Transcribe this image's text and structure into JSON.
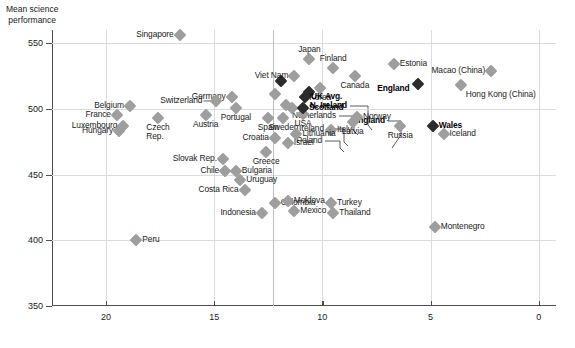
{
  "chart_data": {
    "type": "scatter",
    "title": "",
    "ylabel": "Mean science\nperformance",
    "xlabel": "",
    "ylim": [
      350,
      560
    ],
    "xlim": [
      22.5,
      -0.8
    ],
    "x_reversed": true,
    "grid": true,
    "yticks": [
      550,
      500,
      450,
      400,
      350
    ],
    "xticks": [
      20,
      15,
      10,
      5,
      0
    ],
    "accent_gridline_x": 12.3,
    "colors": {
      "marker": "#9e9e9e",
      "marker_highlight": "#2b2b2b",
      "axis": "#4d4d4d",
      "grid": "#dcdcdc",
      "text": "#1a1a1a"
    },
    "points": [
      {
        "name": "Singapore",
        "x": 16.6,
        "y": 556,
        "label_pos": "r",
        "bold": false
      },
      {
        "name": "N. Ireland",
        "x": 11.9,
        "y": 521,
        "label_pos": "leader",
        "bold": true,
        "label_x": 295,
        "label_y": 76,
        "leader": [
          [
            298,
            76
          ],
          [
            316,
            76
          ],
          [
            316,
            95
          ],
          [
            320,
            100
          ]
        ]
      },
      {
        "name": "Netherlands",
        "x": 12.2,
        "y": 511,
        "label_pos": "leader",
        "bold": false,
        "label_x": 284,
        "label_y": 86,
        "leader": [
          [
            287,
            86
          ],
          [
            302,
            86
          ],
          [
            302,
            101
          ],
          [
            306,
            105
          ]
        ]
      },
      {
        "name": "Ireland",
        "x": 11.7,
        "y": 503,
        "label_pos": "leader",
        "bold": false,
        "label_x": 272,
        "label_y": 99,
        "leader": [
          [
            275,
            99
          ],
          [
            292,
            99
          ],
          [
            292,
            112
          ],
          [
            296,
            116
          ]
        ]
      },
      {
        "name": "Poland",
        "x": 11.4,
        "y": 501,
        "label_pos": "leader",
        "bold": false,
        "label_x": 270,
        "label_y": 111,
        "leader": [
          [
            273,
            111
          ],
          [
            288,
            111
          ],
          [
            288,
            118
          ],
          [
            292,
            122
          ]
        ]
      },
      {
        "name": "England",
        "x": 10.6,
        "y": 513,
        "label_pos": "leader",
        "bold": true,
        "label_x": 333,
        "label_y": 91,
        "leader": [
          [
            336,
            91
          ],
          [
            349,
            91
          ],
          [
            349,
            105
          ],
          [
            340,
            118
          ]
        ]
      },
      {
        "name": "Germany",
        "x": 14.2,
        "y": 509,
        "label_pos": "r",
        "bold": false
      },
      {
        "name": "Switzerland",
        "x": 14.9,
        "y": 506,
        "label_pos": "leaderline",
        "bold": false
      },
      {
        "name": "Belgium",
        "x": 18.9,
        "y": 502,
        "label_pos": "r",
        "bold": false
      },
      {
        "name": "France",
        "x": 19.5,
        "y": 495,
        "label_pos": "r",
        "bold": false
      },
      {
        "name": "Luxembourg",
        "x": 19.2,
        "y": 487,
        "label_pos": "r",
        "bold": false
      },
      {
        "name": "Hungary",
        "x": 19.4,
        "y": 483,
        "label_pos": "r",
        "bold": false
      },
      {
        "name": "Czech\nRep.",
        "x": 17.6,
        "y": 493,
        "label_pos": "below",
        "bold": false
      },
      {
        "name": "Austria",
        "x": 15.4,
        "y": 495,
        "label_pos": "below",
        "bold": false
      },
      {
        "name": "Portugal",
        "x": 14.0,
        "y": 501,
        "label_pos": "below",
        "bold": false
      },
      {
        "name": "Spain",
        "x": 12.5,
        "y": 493,
        "label_pos": "below",
        "bold": false
      },
      {
        "name": "Sweden",
        "x": 11.8,
        "y": 493,
        "label_pos": "below",
        "bold": false
      },
      {
        "name": "USA",
        "x": 10.9,
        "y": 496,
        "label_pos": "below",
        "bold": false
      },
      {
        "name": "Japan",
        "x": 10.6,
        "y": 538,
        "label_pos": "above",
        "bold": false
      },
      {
        "name": "Viet Nam",
        "x": 11.3,
        "y": 525,
        "label_pos": "r",
        "bold": false
      },
      {
        "name": "Finland",
        "x": 9.5,
        "y": 531,
        "label_pos": "above",
        "bold": false
      },
      {
        "name": "Canada",
        "x": 8.5,
        "y": 525,
        "label_pos": "below",
        "bold": false
      },
      {
        "name": "Estonia",
        "x": 6.7,
        "y": 534,
        "label_pos": "l",
        "bold": false
      },
      {
        "name": "Korea",
        "x": 10.1,
        "y": 516,
        "label_pos": "below",
        "bold": false
      },
      {
        "name": "UK Avg.",
        "x": 10.8,
        "y": 509,
        "label_pos": "l",
        "bold": true
      },
      {
        "name": "Scotland",
        "x": 10.9,
        "y": 501,
        "label_pos": "l",
        "bold": true
      },
      {
        "name": "Norway",
        "x": 8.4,
        "y": 494,
        "label_pos": "l",
        "bold": false
      },
      {
        "name": "Latvia",
        "x": 8.6,
        "y": 490,
        "label_pos": "below",
        "bold": false
      },
      {
        "name": "Italy",
        "x": 9.6,
        "y": 484,
        "label_pos": "l",
        "bold": false
      },
      {
        "name": "Lithuania",
        "x": 11.2,
        "y": 481,
        "label_pos": "l",
        "bold": false
      },
      {
        "name": "Israel",
        "x": 11.6,
        "y": 474,
        "label_pos": "l",
        "bold": false
      },
      {
        "name": "Croatia",
        "x": 12.2,
        "y": 478,
        "label_pos": "r",
        "bold": false
      },
      {
        "name": "Greece",
        "x": 12.6,
        "y": 467,
        "label_pos": "below",
        "bold": false
      },
      {
        "name": "Russia",
        "x": 6.4,
        "y": 487,
        "label_pos": "below",
        "bold": false
      },
      {
        "name": "England",
        "x": 5.6,
        "y": 519,
        "label_pos": "belowbold",
        "bold": true
      },
      {
        "name": "Macao (China)",
        "x": 2.2,
        "y": 529,
        "label_pos": "r",
        "bold": false
      },
      {
        "name": "Hong Kong (China)",
        "x": 3.6,
        "y": 518,
        "label_pos": "belowlbl",
        "bold": false
      },
      {
        "name": "Wales",
        "x": 4.9,
        "y": 487,
        "label_pos": "l",
        "bold": true
      },
      {
        "name": "Iceland",
        "x": 4.4,
        "y": 481,
        "label_pos": "l",
        "bold": false
      },
      {
        "name": "Montenegro",
        "x": 4.8,
        "y": 410,
        "label_pos": "l",
        "bold": false
      },
      {
        "name": "Slovak Rep.",
        "x": 14.6,
        "y": 462,
        "label_pos": "r",
        "bold": false
      },
      {
        "name": "Chile",
        "x": 14.5,
        "y": 453,
        "label_pos": "r",
        "bold": false
      },
      {
        "name": "Bulgaria",
        "x": 14.0,
        "y": 453,
        "label_pos": "l",
        "bold": false
      },
      {
        "name": "Uruguay",
        "x": 13.8,
        "y": 446,
        "label_pos": "l",
        "bold": false
      },
      {
        "name": "Costa Rica",
        "x": 13.6,
        "y": 438,
        "label_pos": "r",
        "bold": false
      },
      {
        "name": "Indonesia",
        "x": 12.8,
        "y": 421,
        "label_pos": "r",
        "bold": false
      },
      {
        "name": "Colombia",
        "x": 12.2,
        "y": 428,
        "label_pos": "l",
        "bold": false
      },
      {
        "name": "Mexico",
        "x": 11.3,
        "y": 422,
        "label_pos": "l",
        "bold": false
      },
      {
        "name": "Moldova",
        "x": 11.6,
        "y": 430,
        "label_pos": "l",
        "bold": false
      },
      {
        "name": "Turkey",
        "x": 9.6,
        "y": 428,
        "label_pos": "l",
        "bold": false
      },
      {
        "name": "Thailand",
        "x": 9.5,
        "y": 421,
        "label_pos": "l",
        "bold": false
      },
      {
        "name": "Peru",
        "x": 18.6,
        "y": 400,
        "label_pos": "l",
        "bold": false
      }
    ]
  }
}
